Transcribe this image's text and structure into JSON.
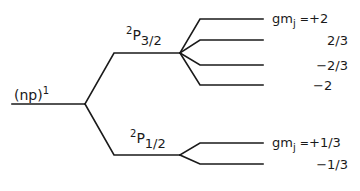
{
  "diagram": {
    "type": "energy-level-splitting",
    "line_color": "#1a1a1a",
    "configuration": {
      "label": "(np)",
      "superscript": "1"
    },
    "fine_structure_levels": [
      {
        "name": "2P3/2",
        "term_superscript": "2",
        "term_letter": "P",
        "term_subscript": "3/2",
        "zeeman_sublevels": [
          {
            "label_prefix": "gm",
            "label_subscript": "j",
            "equals": "=",
            "value": "+2"
          },
          {
            "value": "2/3"
          },
          {
            "value": "−2/3"
          },
          {
            "value": "−2"
          }
        ]
      },
      {
        "name": "2P1/2",
        "term_superscript": "2",
        "term_letter": "P",
        "term_subscript": "1/2",
        "zeeman_sublevels": [
          {
            "label_prefix": "gm",
            "label_subscript": "j",
            "equals": "=",
            "value": "+1/3"
          },
          {
            "value": "−1/3"
          }
        ]
      }
    ]
  }
}
